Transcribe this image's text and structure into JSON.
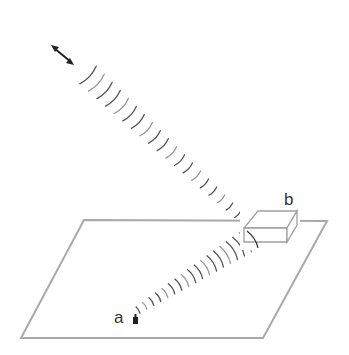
{
  "diagram": {
    "type": "signal-path-diagram",
    "labels": {
      "a": "a",
      "b": "b"
    },
    "colors": {
      "plane": "#a9a9a9",
      "box": "#a0a0a0",
      "wave": "#555555",
      "wave_light": "#999999",
      "icon": "#222222",
      "text": "#333333"
    },
    "elements": {
      "emitter": {
        "name": "double-arrow-emitter",
        "from": [
          52,
          46
        ],
        "to": [
          73,
          64
        ]
      },
      "plane": {
        "corners": [
          [
            84,
            220
          ],
          [
            327,
            221
          ],
          [
            263,
            338
          ],
          [
            21,
            338
          ]
        ]
      },
      "box": {
        "label": "b",
        "position": [
          250,
          210
        ]
      },
      "receiver": {
        "label": "a",
        "position": [
          128,
          316
        ]
      },
      "upper_beam": {
        "from": [
          88,
          75
        ],
        "to": [
          246,
          222
        ],
        "arc_count": 20,
        "size_start": 24,
        "size_end": 8
      },
      "lower_beam": {
        "from": [
          138,
          310
        ],
        "to": [
          252,
          238
        ],
        "arc_count": 18,
        "size_start": 7,
        "size_end": 24
      }
    }
  }
}
